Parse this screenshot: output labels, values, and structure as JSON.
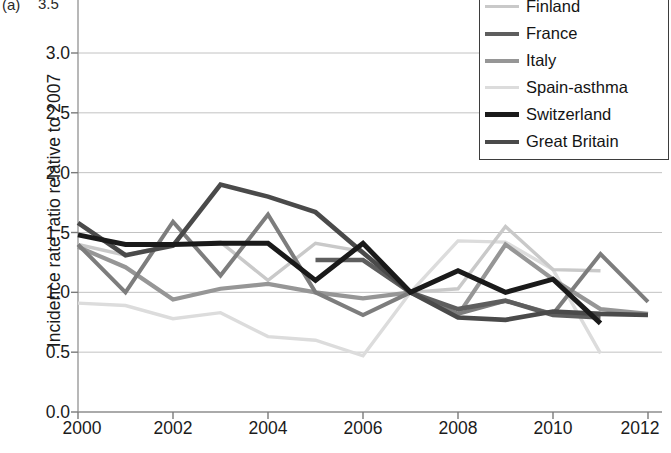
{
  "figure": {
    "panel_label": "(a)",
    "clipped_top_tick": "3.5"
  },
  "axes": {
    "ylabel": "Incidence rate ratio relative to 2007",
    "yticks": [
      "0.0",
      "0.5",
      "1.0",
      "1.5",
      "2.0",
      "2.5",
      "3.0"
    ],
    "xticks": [
      "2000",
      "2002",
      "2004",
      "2006",
      "2008",
      "2010",
      "2012"
    ]
  },
  "legend": {
    "items": [
      {
        "label": "Czech Rep",
        "color": "#7d7d7d",
        "width": 4.0
      },
      {
        "label": "Finland",
        "color": "#c9c9c9",
        "width": 3.4
      },
      {
        "label": "France",
        "color": "#5e5e5e",
        "width": 4.6
      },
      {
        "label": "Italy",
        "color": "#969696",
        "width": 4.2
      },
      {
        "label": "Spain-asthma",
        "color": "#dcdcdc",
        "width": 3.4
      },
      {
        "label": "Switzerland",
        "color": "#1a1a1a",
        "width": 5.0
      },
      {
        "label": "Great Britain",
        "color": "#4a4a4a",
        "width": 4.6
      }
    ]
  },
  "chart_data": {
    "type": "line",
    "title": "",
    "xlabel": "",
    "ylabel": "Incidence rate ratio relative to 2007",
    "xlim": [
      2000,
      2012
    ],
    "ylim": [
      0.0,
      3.0
    ],
    "yticks": [
      0.0,
      0.5,
      1.0,
      1.5,
      2.0,
      2.5,
      3.0
    ],
    "xticks": [
      2000,
      2002,
      2004,
      2006,
      2008,
      2010,
      2012
    ],
    "grid": "horizontal",
    "legend_position": "top-right",
    "reference_year": 2007,
    "series": [
      {
        "name": "Czech Rep",
        "color": "#7d7d7d",
        "width": 4.0,
        "x": [
          2000,
          2001,
          2002,
          2003,
          2004,
          2005,
          2006,
          2007,
          2008,
          2009,
          2010,
          2011,
          2012
        ],
        "y": [
          1.4,
          1.0,
          1.59,
          1.14,
          1.65,
          1.0,
          0.81,
          1.0,
          0.82,
          0.93,
          0.82,
          1.32,
          0.92
        ]
      },
      {
        "name": "Finland",
        "color": "#c9c9c9",
        "width": 3.4,
        "x": [
          2000,
          2001,
          2002,
          2003,
          2004,
          2005,
          2006,
          2007,
          2008,
          2009,
          2010,
          2011
        ],
        "y": [
          1.4,
          1.31,
          1.4,
          1.42,
          1.1,
          1.41,
          1.34,
          1.0,
          1.03,
          1.55,
          1.19,
          1.18
        ]
      },
      {
        "name": "France",
        "color": "#5e5e5e",
        "width": 4.6,
        "x": [
          2005,
          2006,
          2007,
          2008,
          2009,
          2010,
          2011
        ],
        "y": [
          1.27,
          1.27,
          1.0,
          0.86,
          0.93,
          0.81,
          0.79
        ]
      },
      {
        "name": "Italy",
        "color": "#969696",
        "width": 4.2,
        "x": [
          2000,
          2001,
          2002,
          2003,
          2004,
          2005,
          2006,
          2007,
          2008,
          2009,
          2010,
          2011,
          2012
        ],
        "y": [
          1.38,
          1.21,
          0.94,
          1.03,
          1.07,
          1.0,
          0.95,
          1.0,
          0.81,
          1.4,
          1.11,
          0.86,
          0.82
        ]
      },
      {
        "name": "Spain-asthma",
        "color": "#dcdcdc",
        "width": 3.4,
        "x": [
          2000,
          2001,
          2002,
          2003,
          2004,
          2005,
          2006,
          2007,
          2008,
          2009,
          2010,
          2011
        ],
        "y": [
          0.91,
          0.89,
          0.78,
          0.83,
          0.63,
          0.6,
          0.47,
          1.0,
          1.43,
          1.42,
          1.19,
          0.49
        ]
      },
      {
        "name": "Switzerland",
        "color": "#1a1a1a",
        "width": 5.0,
        "x": [
          2000,
          2001,
          2002,
          2003,
          2004,
          2005,
          2006,
          2007,
          2008,
          2009,
          2010,
          2011
        ],
        "y": [
          1.48,
          1.4,
          1.4,
          1.41,
          1.41,
          1.1,
          1.41,
          1.0,
          1.18,
          1.0,
          1.11,
          0.74
        ]
      },
      {
        "name": "Great Britain",
        "color": "#4a4a4a",
        "width": 4.6,
        "x": [
          2000,
          2001,
          2002,
          2003,
          2004,
          2005,
          2006,
          2007,
          2008,
          2009,
          2010,
          2011,
          2012
        ],
        "y": [
          1.58,
          1.31,
          1.39,
          1.9,
          1.8,
          1.67,
          1.33,
          1.0,
          0.79,
          0.77,
          0.84,
          0.82,
          0.81
        ]
      }
    ]
  }
}
